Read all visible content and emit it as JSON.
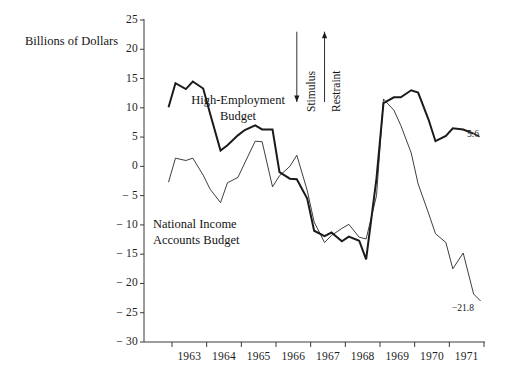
{
  "figure": {
    "y_axis_title": "Billions of Dollars",
    "y_ticks": [
      "25",
      "20",
      "15",
      "10",
      "5",
      "0",
      "− 5",
      "− 10",
      "− 15",
      "− 20",
      "− 25",
      "− 30"
    ],
    "x_ticks": [
      "1963",
      "1964",
      "1965",
      "1966",
      "1967",
      "1968",
      "1969",
      "1970",
      "1971"
    ],
    "series_labels": {
      "high_employment_line1": "High-Employment",
      "high_employment_line2": "Budget",
      "national_income_line1": "National Income",
      "national_income_line2": "Accounts Budget"
    },
    "annotations": {
      "stimulus": "Stimulus",
      "restraint": "Restraint",
      "end_value_high_employment": "5.6",
      "end_value_national_income": "−21.8"
    },
    "colors": {
      "ink": "#1b1b1b",
      "axis": "#3a3a3a",
      "background": "#ffffff"
    }
  },
  "chart_data": {
    "type": "line",
    "title": "",
    "subtitle": "",
    "xlabel": "",
    "ylabel": "Billions of Dollars",
    "ylim": [
      -30,
      25
    ],
    "xlim": [
      1963.0,
      1972.0
    ],
    "ytick_values": [
      25,
      20,
      15,
      10,
      5,
      0,
      -5,
      -10,
      -15,
      -20,
      -25,
      -30
    ],
    "xtick_values": [
      1963,
      1964,
      1965,
      1966,
      1967,
      1968,
      1969,
      1970,
      1971
    ],
    "grid": false,
    "legend": "inline-labels",
    "units": "Billions of Dollars",
    "annotations": [
      {
        "text": "Stimulus",
        "rotation": 90,
        "arrow": "down",
        "x": 1966.6,
        "y_range": [
          23,
          11
        ]
      },
      {
        "text": "Restraint",
        "rotation": 90,
        "arrow": "up",
        "x": 1967.4,
        "y_range": [
          11,
          23
        ]
      },
      {
        "text": "5.6",
        "x": 1971.9,
        "y": 5.6
      },
      {
        "text": "−21.8",
        "x": 1971.9,
        "y": -21.8
      }
    ],
    "series": [
      {
        "name": "High-Employment Budget",
        "style": "thick",
        "x": [
          1962.9,
          1963.1,
          1963.4,
          1963.6,
          1963.9,
          1964.1,
          1964.4,
          1964.6,
          1964.9,
          1965.1,
          1965.4,
          1965.6,
          1965.9,
          1966.1,
          1966.4,
          1966.6,
          1966.9,
          1967.1,
          1967.4,
          1967.6,
          1967.9,
          1968.1,
          1968.4,
          1968.6,
          1968.9,
          1969.1,
          1969.4,
          1969.6,
          1969.9,
          1970.1,
          1970.4,
          1970.6,
          1970.9,
          1971.1,
          1971.4,
          1971.7
        ],
        "values": [
          10.1,
          14.2,
          13.2,
          14.5,
          13.3,
          9.0,
          2.7,
          3.6,
          5.3,
          6.2,
          7.0,
          6.3,
          6.3,
          -1.0,
          -2.1,
          -2.2,
          -5.5,
          -11.0,
          -11.9,
          -11.3,
          -12.8,
          -12.0,
          -12.7,
          -15.9,
          -2.0,
          10.8,
          11.8,
          11.8,
          13.0,
          12.6,
          8.0,
          4.3,
          5.2,
          6.5,
          6.3,
          5.6
        ]
      },
      {
        "name": "National Income Accounts Budget",
        "style": "thin",
        "x": [
          1962.9,
          1963.1,
          1963.4,
          1963.6,
          1963.9,
          1964.1,
          1964.4,
          1964.6,
          1964.9,
          1965.1,
          1965.4,
          1965.6,
          1965.9,
          1966.1,
          1966.4,
          1966.6,
          1966.9,
          1967.1,
          1967.4,
          1967.6,
          1967.9,
          1968.1,
          1968.4,
          1968.6,
          1968.9,
          1969.1,
          1969.4,
          1969.6,
          1969.9,
          1970.1,
          1970.4,
          1970.6,
          1970.9,
          1971.1,
          1971.4,
          1971.7
        ],
        "values": [
          -2.7,
          1.4,
          1.0,
          1.4,
          -1.5,
          -3.9,
          -6.2,
          -2.8,
          -1.9,
          0.6,
          4.3,
          4.2,
          -3.5,
          -1.6,
          0.0,
          1.9,
          -4.1,
          -9.5,
          -13.0,
          -11.8,
          -10.6,
          -9.9,
          -12.1,
          -12.4,
          -5.0,
          11.5,
          9.6,
          7.0,
          2.3,
          -3.0,
          -8.0,
          -11.5,
          -13.0,
          -17.5,
          -14.8,
          -21.8
        ]
      }
    ]
  }
}
